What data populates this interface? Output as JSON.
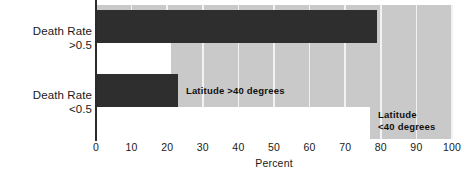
{
  "chart_data": {
    "type": "bar",
    "orientation": "horizontal",
    "title": "",
    "xlabel": "Percent",
    "ylabel": "",
    "xlim": [
      0,
      100
    ],
    "xticks": [
      0,
      10,
      20,
      30,
      40,
      50,
      60,
      70,
      80,
      90,
      100
    ],
    "grid": true,
    "legend_position": "inline-annotations",
    "categories": [
      "Death Rate >0.5",
      "Death Rate <0.5"
    ],
    "category_lines": [
      {
        "line1": "Death  Rate",
        "line2": ">0.5"
      },
      {
        "line1": "Death  Rate",
        "line2": "<0.5"
      }
    ],
    "series": [
      {
        "name": "Latitude >40 degrees",
        "color": "#2e2e2e",
        "values": [
          79,
          23
        ]
      },
      {
        "name": "Latitude <40 degrees",
        "color": "#ffffff",
        "values": [
          21,
          77
        ]
      }
    ],
    "annotations": [
      {
        "text": "Latitude  >40  degrees",
        "lines": [
          "Latitude  >40  degrees"
        ],
        "x": 25,
        "y_group": 1
      },
      {
        "text": "Latitude <40  degrees",
        "lines": [
          "Latitude",
          "<40  degrees"
        ],
        "x": 79,
        "y_group": 1
      }
    ],
    "colors": {
      "plot_background": "#c9c9c9",
      "gridline": "#f2f2f2",
      "dark_bar": "#2e2e2e",
      "light_bar": "#ffffff",
      "axis": "#2b2b2b",
      "text": "#1a1a1a",
      "page_background": "#ffffff"
    }
  },
  "axis": {
    "tick_labels": [
      "0",
      "10",
      "20",
      "30",
      "40",
      "50",
      "60",
      "70",
      "80",
      "90",
      "100"
    ],
    "title": "Percent"
  },
  "annotations": {
    "lat_gt40": "Latitude  >40  degrees",
    "lat_lt40_line1": "Latitude",
    "lat_lt40_line2": "<40  degrees"
  },
  "labels": {
    "group0_line1": "Death  Rate",
    "group0_line2": ">0.5",
    "group1_line1": "Death  Rate",
    "group1_line2": "<0.5"
  }
}
